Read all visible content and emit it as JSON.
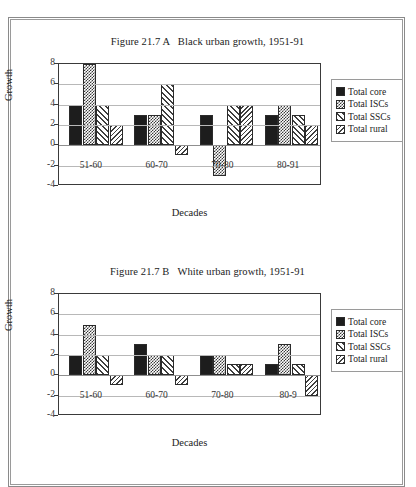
{
  "figures": [
    {
      "title": "Figure 21.7 A   Black urban growth, 1951-91",
      "xlabel": "Decades",
      "ylabel": "Growth",
      "yticks": [
        "8",
        "6",
        "4",
        "2",
        "0",
        "-2",
        "-4"
      ],
      "xticks": [
        "51-60",
        "60-70",
        "70-80",
        "80-91"
      ],
      "legend": [
        "Total core",
        "Total ISCs",
        "Total SSCs",
        "Total rural"
      ]
    },
    {
      "title": "Figure 21.7 B   White urban growth, 1951-91",
      "xlabel": "Decades",
      "ylabel": "Growth",
      "yticks": [
        "8",
        "6",
        "4",
        "2",
        "0",
        "-2",
        "-4"
      ],
      "xticks": [
        "51-60",
        "60-70",
        "70-80",
        "80-9"
      ],
      "legend": [
        "Total core",
        "Total ISCs",
        "Total SSCs",
        "Total rural"
      ]
    }
  ],
  "chart_data": [
    {
      "type": "bar",
      "title": "Figure 21.7 A   Black urban growth, 1951-91",
      "xlabel": "Decades",
      "ylabel": "Growth",
      "ylim": [
        -4,
        8
      ],
      "ytick_step": 2,
      "grid": true,
      "legend_position": "right",
      "categories": [
        "51-60",
        "60-70",
        "70-80",
        "80-91"
      ],
      "series": [
        {
          "name": "Total core",
          "pattern": "solid-black",
          "values": [
            4,
            3,
            3,
            3
          ]
        },
        {
          "name": "Total ISCs",
          "pattern": "checker-dots",
          "values": [
            8,
            3,
            -3,
            4
          ]
        },
        {
          "name": "Total SSCs",
          "pattern": "diagonal-hatch",
          "values": [
            4,
            6,
            4,
            3
          ]
        },
        {
          "name": "Total rural",
          "pattern": "reverse-diagonal",
          "values": [
            2,
            -1,
            4,
            2
          ]
        }
      ]
    },
    {
      "type": "bar",
      "title": "Figure 21.7 B   White urban growth, 1951-91",
      "xlabel": "Decades",
      "ylabel": "Growth",
      "ylim": [
        -4,
        8
      ],
      "ytick_step": 2,
      "grid": true,
      "legend_position": "right",
      "categories": [
        "51-60",
        "60-70",
        "70-80",
        "80-9"
      ],
      "series": [
        {
          "name": "Total core",
          "pattern": "solid-black",
          "values": [
            2,
            3.1,
            2,
            1.1
          ]
        },
        {
          "name": "Total ISCs",
          "pattern": "checker-dots",
          "values": [
            5,
            2,
            2,
            3.1
          ]
        },
        {
          "name": "Total SSCs",
          "pattern": "diagonal-hatch",
          "values": [
            2,
            2,
            1.1,
            1.1
          ]
        },
        {
          "name": "Total rural",
          "pattern": "reverse-diagonal",
          "values": [
            -1,
            -1,
            1.1,
            -2
          ]
        }
      ]
    }
  ]
}
